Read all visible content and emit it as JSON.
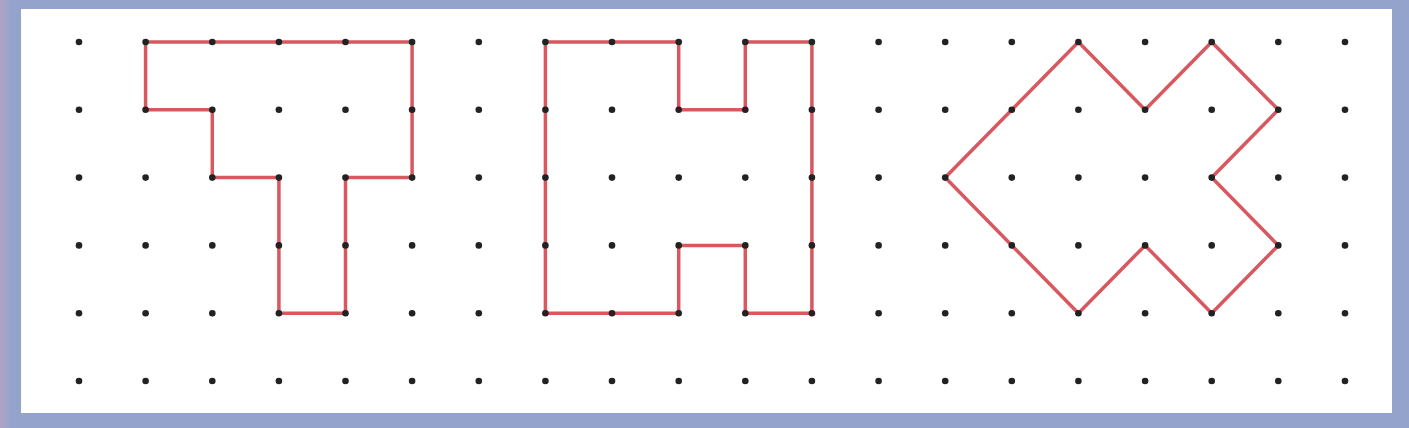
{
  "grid": {
    "columns": 20,
    "rows": 6,
    "dot_color": "#222222"
  },
  "line_color": "#d9575f",
  "shapes": [
    {
      "name": "t-shape",
      "vertices": [
        [
          1,
          0
        ],
        [
          5,
          0
        ],
        [
          5,
          2
        ],
        [
          4,
          2
        ],
        [
          4,
          4
        ],
        [
          3,
          4
        ],
        [
          3,
          2
        ],
        [
          2,
          2
        ],
        [
          2,
          1
        ],
        [
          1,
          1
        ]
      ]
    },
    {
      "name": "h-shape",
      "vertices": [
        [
          7,
          0
        ],
        [
          9,
          0
        ],
        [
          9,
          1
        ],
        [
          10,
          1
        ],
        [
          10,
          0
        ],
        [
          11,
          0
        ],
        [
          11,
          4
        ],
        [
          10,
          4
        ],
        [
          10,
          3
        ],
        [
          9,
          3
        ],
        [
          9,
          4
        ],
        [
          7,
          4
        ]
      ]
    },
    {
      "name": "arrow-x-shape",
      "vertices": [
        [
          13,
          2
        ],
        [
          15,
          0
        ],
        [
          16,
          1
        ],
        [
          17,
          0
        ],
        [
          18,
          1
        ],
        [
          17,
          2
        ],
        [
          18,
          3
        ],
        [
          17,
          4
        ],
        [
          16,
          3
        ],
        [
          15,
          4
        ]
      ]
    }
  ]
}
